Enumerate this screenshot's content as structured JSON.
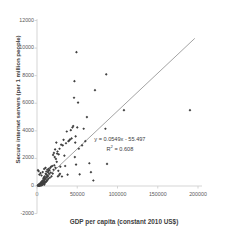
{
  "chart_data": {
    "type": "scatter",
    "title": "",
    "xlabel": "GDP per capita (constant 2010 US$)",
    "ylabel": "Secure internet servers (per 1 million people)",
    "xlim": [
      0,
      200000
    ],
    "ylim": [
      -2000,
      12000
    ],
    "xticks": [
      0,
      50000,
      100000,
      150000,
      200000
    ],
    "xtick_labels": [
      "0",
      "50000",
      "100000",
      "150000",
      "200000"
    ],
    "yticks": [
      -2000,
      0,
      2000,
      4000,
      6000,
      8000,
      10000,
      12000
    ],
    "ytick_labels": [
      "-2000",
      "0",
      "2000",
      "4000",
      "6000",
      "8000",
      "10000",
      "12000"
    ],
    "grid": false,
    "legend": "none",
    "marker_color": "#404040",
    "marker_shape": "diamond",
    "trendline": {
      "type": "linear",
      "slope": 0.0549,
      "intercept": -55.497,
      "r_squared": 0.608,
      "equation_label": "y = 0.0549x - 55.497",
      "r2_label": "R² = 0.608",
      "color": "#8c8c8c",
      "x_start": 0,
      "x_end": 196000
    },
    "annotations": [
      {
        "text": "y = 0.0549x - 55.497",
        "x": 103000,
        "y": 3400
      },
      {
        "text": "R² = 0.608",
        "x": 103000,
        "y": 2850
      }
    ],
    "points": [
      [
        2000,
        60
      ],
      [
        2400,
        90
      ],
      [
        2800,
        40
      ],
      [
        3100,
        120
      ],
      [
        3400,
        70
      ],
      [
        3700,
        160
      ],
      [
        4000,
        100
      ],
      [
        4300,
        210
      ],
      [
        4600,
        55
      ],
      [
        4900,
        140
      ],
      [
        5200,
        260
      ],
      [
        5500,
        95
      ],
      [
        5800,
        320
      ],
      [
        6100,
        180
      ],
      [
        6400,
        80
      ],
      [
        6700,
        240
      ],
      [
        7000,
        400
      ],
      [
        7300,
        150
      ],
      [
        7600,
        300
      ],
      [
        7900,
        520
      ],
      [
        8200,
        190
      ],
      [
        8500,
        620
      ],
      [
        8800,
        350
      ],
      [
        9100,
        105
      ],
      [
        9400,
        470
      ],
      [
        9700,
        700
      ],
      [
        10000,
        260
      ],
      [
        10400,
        560
      ],
      [
        10800,
        880
      ],
      [
        11200,
        330
      ],
      [
        11600,
        1050
      ],
      [
        12000,
        640
      ],
      [
        12400,
        430
      ],
      [
        12800,
        1180
      ],
      [
        13200,
        760
      ],
      [
        13600,
        1000
      ],
      [
        14000,
        520
      ],
      [
        14500,
        1250
      ],
      [
        15000,
        880
      ],
      [
        15500,
        1150
      ],
      [
        16000,
        600
      ],
      [
        16500,
        1320
      ],
      [
        17000,
        980
      ],
      [
        17500,
        1400
      ],
      [
        18000,
        700
      ],
      [
        1000,
        35
      ],
      [
        1300,
        55
      ],
      [
        1600,
        20
      ],
      [
        1900,
        75
      ],
      [
        2200,
        30
      ],
      [
        2500,
        110
      ],
      [
        2900,
        45
      ],
      [
        3300,
        85
      ],
      [
        3600,
        25
      ],
      [
        4100,
        130
      ],
      [
        4500,
        65
      ],
      [
        5000,
        175
      ],
      [
        5400,
        50
      ],
      [
        6000,
        145
      ],
      [
        6600,
        290
      ],
      [
        7200,
        115
      ],
      [
        7800,
        215
      ],
      [
        8400,
        170
      ],
      [
        9000,
        380
      ],
      [
        9600,
        225
      ],
      [
        10200,
        540
      ],
      [
        11000,
        290
      ],
      [
        11800,
        820
      ],
      [
        12600,
        390
      ],
      [
        13400,
        690
      ],
      [
        14200,
        1090
      ],
      [
        1200,
        1150
      ],
      [
        2100,
        1080
      ],
      [
        3000,
        830
      ],
      [
        4400,
        940
      ],
      [
        5600,
        760
      ],
      [
        7100,
        1010
      ],
      [
        8900,
        1240
      ],
      [
        10600,
        1320
      ],
      [
        19000,
        1450
      ],
      [
        19500,
        900
      ],
      [
        20000,
        2250
      ],
      [
        20500,
        1180
      ],
      [
        21000,
        2400
      ],
      [
        21500,
        1500
      ],
      [
        22000,
        2100
      ],
      [
        22500,
        2650
      ],
      [
        23000,
        1320
      ],
      [
        23500,
        1960
      ],
      [
        24000,
        3150
      ],
      [
        24500,
        1750
      ],
      [
        25000,
        2350
      ],
      [
        25500,
        2500
      ],
      [
        26000,
        700
      ],
      [
        26500,
        1100
      ],
      [
        27000,
        2300
      ],
      [
        27500,
        790
      ],
      [
        28000,
        2700
      ],
      [
        28500,
        880
      ],
      [
        29000,
        1400
      ],
      [
        30000,
        3000
      ],
      [
        31000,
        690
      ],
      [
        32000,
        2950
      ],
      [
        33000,
        3350
      ],
      [
        34000,
        2200
      ],
      [
        35000,
        1450
      ],
      [
        36000,
        3100
      ],
      [
        37000,
        3950
      ],
      [
        38000,
        820
      ],
      [
        39000,
        3250
      ],
      [
        40000,
        3300
      ],
      [
        41000,
        3380
      ],
      [
        42000,
        4050
      ],
      [
        43000,
        3450
      ],
      [
        44000,
        4250
      ],
      [
        45000,
        4350
      ],
      [
        46000,
        6400
      ],
      [
        46500,
        7600
      ],
      [
        47000,
        2100
      ],
      [
        47500,
        3150
      ],
      [
        48000,
        3600
      ],
      [
        48500,
        1550
      ],
      [
        49000,
        9700
      ],
      [
        50000,
        4250
      ],
      [
        51000,
        6050
      ],
      [
        52000,
        2700
      ],
      [
        53000,
        850
      ],
      [
        56000,
        2950
      ],
      [
        58000,
        4150
      ],
      [
        60000,
        3250
      ],
      [
        62000,
        5000
      ],
      [
        65000,
        1650
      ],
      [
        67000,
        1000
      ],
      [
        70000,
        400
      ],
      [
        72000,
        6950
      ],
      [
        85000,
        4150
      ],
      [
        86000,
        8100
      ],
      [
        87000,
        1600
      ],
      [
        108000,
        5500
      ],
      [
        190000,
        5500
      ]
    ]
  }
}
